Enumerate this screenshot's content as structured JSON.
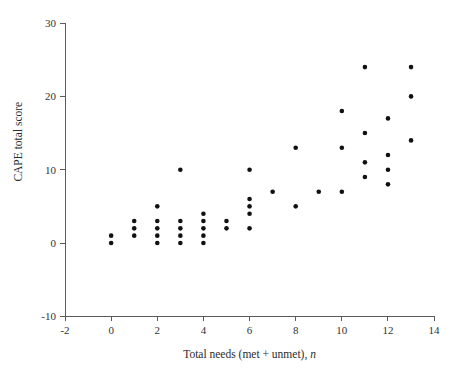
{
  "chart_data": {
    "type": "scatter",
    "title": "",
    "xlabel": "Total needs (met + unmet), n",
    "xlabel_plain": "Total needs (met + unmet),",
    "xlabel_italic": "n",
    "ylabel": "CAPE total score",
    "xlim": [
      -2,
      14
    ],
    "ylim": [
      -10,
      30
    ],
    "xticks": [
      -2,
      0,
      2,
      4,
      6,
      8,
      10,
      12,
      14
    ],
    "xtick_labels": [
      "-2",
      "0",
      "2",
      "4",
      "6",
      "8",
      "10",
      "12",
      "14"
    ],
    "yticks": [
      -10,
      0,
      10,
      20,
      30
    ],
    "ytick_labels": [
      "-10",
      "0",
      "10",
      "20",
      "30"
    ],
    "grid": false,
    "legend": false,
    "marker": "filled-circle",
    "marker_color": "#111111",
    "marker_size_px": 4.6,
    "points": [
      {
        "x": 0,
        "y": 1
      },
      {
        "x": 0,
        "y": 0
      },
      {
        "x": 1,
        "y": 3
      },
      {
        "x": 1,
        "y": 2
      },
      {
        "x": 1,
        "y": 1
      },
      {
        "x": 2,
        "y": 5
      },
      {
        "x": 2,
        "y": 3
      },
      {
        "x": 2,
        "y": 2
      },
      {
        "x": 2,
        "y": 1
      },
      {
        "x": 2,
        "y": 0
      },
      {
        "x": 3,
        "y": 10
      },
      {
        "x": 3,
        "y": 3
      },
      {
        "x": 3,
        "y": 2
      },
      {
        "x": 3,
        "y": 1
      },
      {
        "x": 3,
        "y": 0
      },
      {
        "x": 4,
        "y": 4
      },
      {
        "x": 4,
        "y": 3
      },
      {
        "x": 4,
        "y": 2
      },
      {
        "x": 4,
        "y": 1
      },
      {
        "x": 4,
        "y": 0
      },
      {
        "x": 5,
        "y": 3
      },
      {
        "x": 5,
        "y": 2
      },
      {
        "x": 6,
        "y": 10
      },
      {
        "x": 6,
        "y": 6
      },
      {
        "x": 6,
        "y": 5
      },
      {
        "x": 6,
        "y": 4
      },
      {
        "x": 6,
        "y": 2
      },
      {
        "x": 7,
        "y": 7
      },
      {
        "x": 8,
        "y": 13
      },
      {
        "x": 8,
        "y": 5
      },
      {
        "x": 9,
        "y": 7
      },
      {
        "x": 10,
        "y": 18
      },
      {
        "x": 10,
        "y": 13
      },
      {
        "x": 10,
        "y": 7
      },
      {
        "x": 11,
        "y": 24
      },
      {
        "x": 11,
        "y": 15
      },
      {
        "x": 11,
        "y": 11
      },
      {
        "x": 11,
        "y": 9
      },
      {
        "x": 12,
        "y": 17
      },
      {
        "x": 12,
        "y": 12
      },
      {
        "x": 12,
        "y": 10
      },
      {
        "x": 12,
        "y": 8
      },
      {
        "x": 13,
        "y": 24
      },
      {
        "x": 13,
        "y": 20
      },
      {
        "x": 13,
        "y": 14
      }
    ],
    "colors": {
      "axis": "#5b5b5b",
      "text": "#333333",
      "marker": "#111111",
      "background": "#ffffff"
    }
  }
}
